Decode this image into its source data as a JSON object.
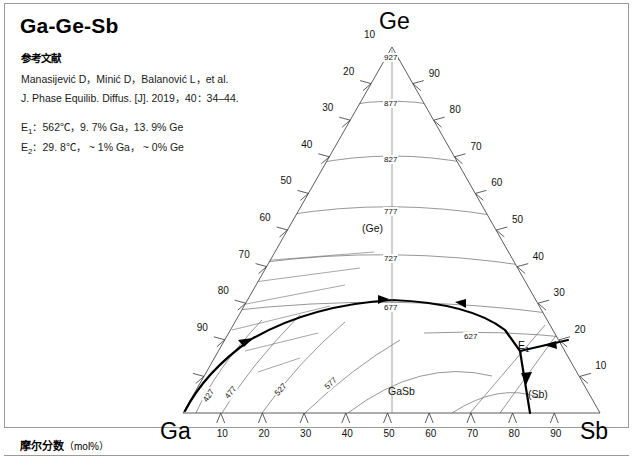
{
  "title": "Ga-Ge-Sb",
  "reference": {
    "heading": "参考文献",
    "line1": "Manasijević D，Minić D，Balanović L，et al.",
    "line2": "J. Phase Equilib. Diffus. [J]. 2019，40：34–44."
  },
  "invariants": {
    "e1_label": "E",
    "e1_sub": "1",
    "e1_text": "：562℃，9. 7% Ga，13. 9% Ge",
    "e2_label": "E",
    "e2_sub": "2",
    "e2_text": "：29. 8℃， ~ 1% Ga， ~ 0% Ge"
  },
  "footer": {
    "text": "摩尔分数",
    "unit": "（mol%）"
  },
  "corners": {
    "top": "Ge",
    "left": "Ga",
    "right": "Sb"
  },
  "axis_ticks": {
    "bottom": [
      "10",
      "20",
      "30",
      "40",
      "50",
      "60",
      "70",
      "80",
      "90"
    ],
    "left": [
      "10",
      "20",
      "30",
      "40",
      "50",
      "60",
      "70",
      "80",
      "90"
    ],
    "right": [
      "90",
      "80",
      "70",
      "60",
      "50",
      "40",
      "30",
      "20",
      "10"
    ]
  },
  "phase_labels": [
    {
      "name": "ge-phase",
      "text": "(Ge)",
      "x": 362,
      "y": 222
    },
    {
      "name": "gasb-phase",
      "text": "GaSb",
      "x": 388,
      "y": 385
    },
    {
      "name": "sb-phase",
      "text": "(Sb)",
      "x": 528,
      "y": 388
    }
  ],
  "eutectic_point": {
    "label": "E",
    "sub": "1",
    "x": 520,
    "y": 345
  },
  "isotherms": [
    {
      "value": "927",
      "x": 392,
      "y": 58
    },
    {
      "value": "877",
      "x": 392,
      "y": 104
    },
    {
      "value": "827",
      "x": 392,
      "y": 160
    },
    {
      "value": "777",
      "x": 392,
      "y": 212
    },
    {
      "value": "727",
      "x": 392,
      "y": 259
    },
    {
      "value": "677",
      "x": 392,
      "y": 308
    },
    {
      "value": "627",
      "x": 472,
      "y": 337
    },
    {
      "value": "577",
      "x": 332,
      "y": 384
    },
    {
      "value": "527",
      "x": 282,
      "y": 390
    },
    {
      "value": "477",
      "x": 232,
      "y": 393
    },
    {
      "value": "427",
      "x": 210,
      "y": 396
    }
  ],
  "chart_data": {
    "type": "ternary-phase-diagram",
    "title": "Ga-Ge-Sb",
    "components": [
      "Ga",
      "Ge",
      "Sb"
    ],
    "axis_unit": "mol%",
    "liquidus_isotherms_celsius": [
      927,
      877,
      827,
      777,
      727,
      677,
      627,
      577,
      527,
      477,
      427
    ],
    "phase_regions": [
      "(Ge)",
      "GaSb",
      "(Sb)"
    ],
    "invariant_reactions": [
      {
        "name": "E1",
        "temperature_C": 562,
        "Ga_pct": 9.7,
        "Ge_pct": 13.9
      },
      {
        "name": "E2",
        "temperature_C": 29.8,
        "Ga_pct": 1,
        "Ge_pct": 0
      }
    ]
  }
}
